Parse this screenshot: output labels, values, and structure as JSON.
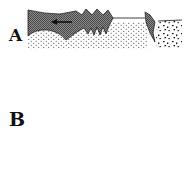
{
  "figure": {
    "panels": [
      {
        "id": "A",
        "label": "A",
        "description": "Cross-section: dark eroded band with leftward arrow over stippled sediment; dark wedge and coarse-grained region on right"
      },
      {
        "id": "B",
        "label": "B",
        "description": "Plan view between two horizontal lines: one dashed wavy line, three dashed curved lines, lens of fine stipple bounded by solid curves, coarse-grained region on right; compression arrows at top and bottom"
      }
    ],
    "colors": {
      "ink": "#111111",
      "hatch": "#6b6b6b",
      "background": "#ffffff"
    },
    "arrows": [
      {
        "panel": "A",
        "direction": "left"
      },
      {
        "panel": "B",
        "direction": "down",
        "position": "top"
      },
      {
        "panel": "B",
        "direction": "up",
        "position": "bottom"
      }
    ]
  }
}
